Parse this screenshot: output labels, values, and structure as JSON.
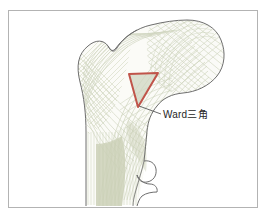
{
  "figure": {
    "type": "anatomical-illustration",
    "frame": {
      "border_color": "#b3b3b3",
      "background_color": "#ffffff",
      "x": 8,
      "y": 10,
      "width": 250,
      "height": 198
    }
  },
  "labels": {
    "ward_triangle": "Ward三角"
  },
  "annotation": {
    "leader_line_color": "#595959",
    "highlight": {
      "name": "ward-triangle",
      "stroke_color": "#c0544a",
      "fill_color": "#cfd6c2"
    }
  },
  "colors": {
    "cortex_outline": "#6e6e6e",
    "trabecular_line": "#ccd2bb",
    "marrow_fill": "#ccd1b8",
    "bone_fill": "#fbfbf7",
    "label_text": "#262626"
  },
  "icons": {
    "ward_triangle_marker": "triangle-icon",
    "leader": "leader-line-icon"
  }
}
